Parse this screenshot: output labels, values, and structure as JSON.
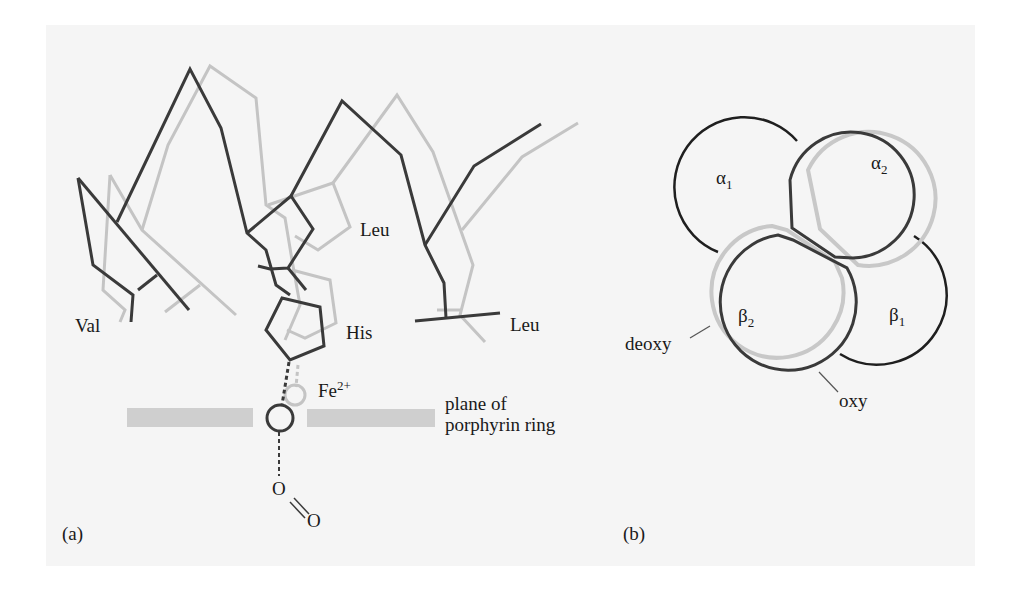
{
  "figure": {
    "panel_a": {
      "label": "(a)",
      "residues": {
        "val": "Val",
        "leu_upper": "Leu",
        "his": "His",
        "leu_lower": "Leu"
      },
      "iron": {
        "symbol": "Fe",
        "charge": "2+"
      },
      "plane_label_line1": "plane of",
      "plane_label_line2": "porphyrin ring",
      "oxygen_1": "O",
      "oxygen_2": "O"
    },
    "panel_b": {
      "label": "(b)",
      "subunits": {
        "alpha1": {
          "greek": "α",
          "sub": "1"
        },
        "alpha2": {
          "greek": "α",
          "sub": "2"
        },
        "beta1": {
          "greek": "β",
          "sub": "1"
        },
        "beta2": {
          "greek": "β",
          "sub": "2"
        }
      },
      "deoxy_label": "deoxy",
      "oxy_label": "oxy"
    },
    "colors": {
      "oxy_stroke": "#3a3a3a",
      "deoxy_stroke": "#c4c4c4",
      "plane_fill": "#cfcfcf",
      "background": "#f5f5f5"
    }
  }
}
